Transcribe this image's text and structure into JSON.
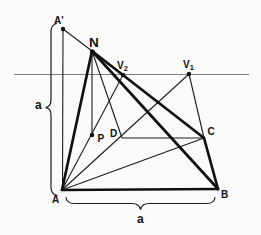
{
  "figure": {
    "kind": "geometry-perspective-diagram",
    "colors": {
      "background": "#fbfbfb",
      "line": "#1c1c1c",
      "thick_line": "#101010",
      "horizon_line": "#7d7d7d",
      "label_text": "#111111"
    },
    "labels": {
      "a_prime": "A'",
      "apex": "N",
      "v2_base": "V",
      "v2_sub": "2",
      "v1_base": "V",
      "v1_sub": "1",
      "foot": "P",
      "d": "D",
      "c": "C",
      "a": "A",
      "b": "B",
      "dim_left": "a",
      "dim_bottom": "a"
    }
  }
}
